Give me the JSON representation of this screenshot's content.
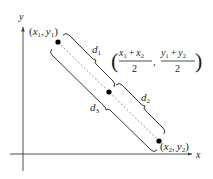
{
  "diagram": {
    "axes": {
      "x_label": "x",
      "y_label": "y"
    },
    "points": [
      {
        "id": "p1",
        "label_x": "x",
        "label_x_sub": "1",
        "label_y": "y",
        "label_y_sub": "1"
      },
      {
        "id": "midpoint",
        "label": "((x1 + x2)/2, (y1 + y2)/2)",
        "num1_a": "x",
        "num1_a_sub": "1",
        "num1_b": "x",
        "num1_b_sub": "2",
        "den1": "2",
        "num2_a": "y",
        "num2_a_sub": "1",
        "num2_b": "y",
        "num2_b_sub": "2",
        "den2": "2"
      },
      {
        "id": "p2",
        "label_x": "x",
        "label_x_sub": "2",
        "label_y": "y",
        "label_y_sub": "2"
      }
    ],
    "distances": [
      {
        "name": "d",
        "sub": "1"
      },
      {
        "name": "d",
        "sub": "2"
      },
      {
        "name": "d",
        "sub": "3"
      }
    ],
    "symbols": {
      "open_paren": "(",
      "close_paren": ")",
      "comma": ",",
      "plus": "+"
    },
    "colors": {
      "ink": "#231f20",
      "axis": "#3a3a3a",
      "dashed": "#8a8a8a"
    }
  }
}
